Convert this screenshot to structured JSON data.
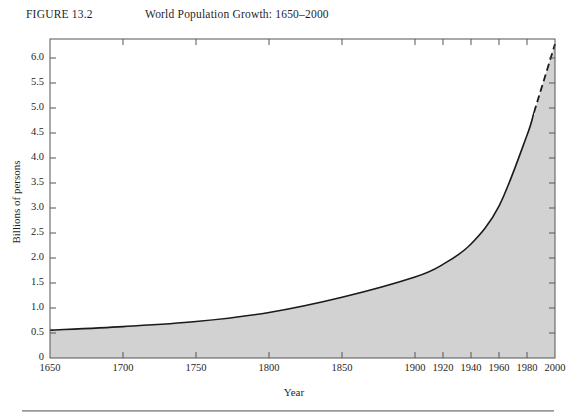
{
  "header": {
    "figure_number": "FIGURE 13.2",
    "title": "World Population Growth: 1650–2000"
  },
  "colors": {
    "fill": "#d2d2d2",
    "line": "#1a1a1a",
    "frame": "#555555",
    "rule": "#8e8e8e",
    "background": "#ffffff"
  },
  "chart_data": {
    "type": "area",
    "title": "World Population Growth: 1650–2000",
    "xlabel": "Year",
    "ylabel": "Billions of persons",
    "xlim": [
      1650,
      2000
    ],
    "ylim": [
      0,
      6.3
    ],
    "grid": false,
    "legend": null,
    "y_ticks": [
      "0",
      "0.5",
      "1.0",
      "1.5",
      "2.0",
      "2.5",
      "3.0",
      "3.5",
      "4.0",
      "4.5",
      "5.0",
      "5.5",
      "6.0"
    ],
    "y_tick_values": [
      0,
      0.5,
      1.0,
      1.5,
      2.0,
      2.5,
      3.0,
      3.5,
      4.0,
      4.5,
      5.0,
      5.5,
      6.0
    ],
    "x_ticks": [
      "1650",
      "1700",
      "1750",
      "1800",
      "1850",
      "1900",
      "1920",
      "1940",
      "1960",
      "1980",
      "2000"
    ],
    "x_tick_values": [
      1650,
      1700,
      1750,
      1800,
      1850,
      1900,
      1920,
      1940,
      1960,
      1980,
      2000
    ],
    "x_axis_note": "axis is compressed before 1900 and expanded after 1900 (non-linear scale)",
    "series": [
      {
        "name": "World population",
        "style": "solid-with-dashed-projection",
        "dashed_from_year": 1985,
        "x": [
          1650,
          1700,
          1750,
          1800,
          1850,
          1900,
          1920,
          1940,
          1960,
          1980,
          1985,
          1990,
          2000
        ],
        "values": [
          0.55,
          0.62,
          0.72,
          0.9,
          1.2,
          1.6,
          1.85,
          2.25,
          3.0,
          4.4,
          4.85,
          5.3,
          6.2
        ]
      }
    ]
  },
  "axis_ticks": {
    "y": [
      {
        "label": "6.0",
        "y": 58
      },
      {
        "label": "5.5",
        "y": 83
      },
      {
        "label": "5.0",
        "y": 108
      },
      {
        "label": "4.5",
        "y": 133
      },
      {
        "label": "4.0",
        "y": 158
      },
      {
        "label": "3.5",
        "y": 183
      },
      {
        "label": "3.0",
        "y": 208
      },
      {
        "label": "2.5",
        "y": 233
      },
      {
        "label": "2.0",
        "y": 258
      },
      {
        "label": "1.5",
        "y": 283
      },
      {
        "label": "1.0",
        "y": 308
      },
      {
        "label": "0.5",
        "y": 333
      },
      {
        "label": "0",
        "y": 358
      }
    ],
    "x": [
      {
        "label": "1650",
        "x": 50
      },
      {
        "label": "1700",
        "x": 123
      },
      {
        "label": "1750",
        "x": 196
      },
      {
        "label": "1800",
        "x": 269
      },
      {
        "label": "1850",
        "x": 342
      },
      {
        "label": "1900",
        "x": 415
      },
      {
        "label": "1920",
        "x": 443
      },
      {
        "label": "1940",
        "x": 471
      },
      {
        "label": "1960",
        "x": 499
      },
      {
        "label": "1980",
        "x": 527
      },
      {
        "label": "2000",
        "x": 555
      }
    ]
  }
}
